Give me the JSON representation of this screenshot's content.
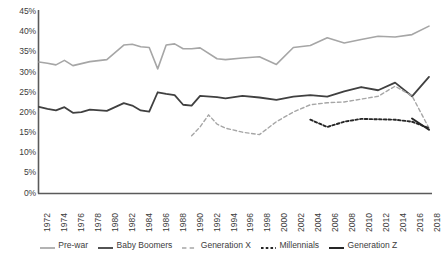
{
  "chart_data": {
    "type": "line",
    "title": "",
    "xlabel": "",
    "ylabel": "",
    "xlim": [
      1972,
      2018
    ],
    "ylim": [
      0,
      45
    ],
    "grid": false,
    "legend_position": "bottom",
    "ytick_labels": [
      "45%",
      "40%",
      "35%",
      "30%",
      "25%",
      "20%",
      "15%",
      "10%",
      "5%",
      "0%"
    ],
    "ytick_values": [
      45,
      40,
      35,
      30,
      25,
      20,
      15,
      10,
      5,
      0
    ],
    "xtick_labels": [
      "1972",
      "1974",
      "1976",
      "1978",
      "1980",
      "1982",
      "1984",
      "1986",
      "1988",
      "1990",
      "1992",
      "1994",
      "1996",
      "1998",
      "2000",
      "2002",
      "2004",
      "2006",
      "2008",
      "2010",
      "2012",
      "2014",
      "2016",
      "2018"
    ],
    "xtick_values": [
      1972,
      1974,
      1976,
      1978,
      1980,
      1982,
      1984,
      1986,
      1988,
      1990,
      1992,
      1994,
      1996,
      1998,
      2000,
      2002,
      2004,
      2006,
      2008,
      2010,
      2012,
      2014,
      2016,
      2018
    ],
    "series": [
      {
        "name": "Pre-war",
        "color": "#a6a6a6",
        "style": "solid",
        "width": 1.6,
        "x": [
          1972,
          1973,
          1974,
          1975,
          1976,
          1977,
          1978,
          1980,
          1982,
          1983,
          1984,
          1985,
          1986,
          1987,
          1988,
          1989,
          1990,
          1991,
          1993,
          1994,
          1996,
          1998,
          2000,
          2002,
          2004,
          2006,
          2008,
          2010,
          2012,
          2014,
          2016,
          2018
        ],
        "y": [
          32.6,
          32.3,
          31.9,
          33.0,
          31.7,
          32.2,
          32.7,
          33.2,
          36.8,
          37.0,
          36.4,
          36.2,
          30.9,
          36.8,
          37.1,
          35.9,
          35.9,
          36.1,
          33.4,
          33.2,
          33.6,
          33.9,
          32.0,
          36.2,
          36.7,
          38.6,
          37.3,
          38.2,
          39.0,
          38.8,
          39.4,
          41.5
        ]
      },
      {
        "name": "Baby Boomers",
        "color": "#404040",
        "style": "solid",
        "width": 1.8,
        "x": [
          1972,
          1973,
          1974,
          1975,
          1976,
          1977,
          1978,
          1980,
          1982,
          1983,
          1984,
          1985,
          1986,
          1987,
          1988,
          1989,
          1990,
          1991,
          1993,
          1994,
          1996,
          1998,
          2000,
          2002,
          2004,
          2006,
          2008,
          2010,
          2012,
          2014,
          2016,
          2018
        ],
        "y": [
          21.5,
          21.0,
          20.6,
          21.4,
          20.0,
          20.2,
          20.8,
          20.5,
          22.4,
          21.8,
          20.6,
          20.3,
          25.1,
          24.7,
          24.4,
          22.0,
          21.8,
          24.2,
          23.9,
          23.6,
          24.2,
          23.8,
          23.2,
          24.0,
          24.4,
          24.0,
          25.3,
          26.4,
          25.6,
          27.5,
          24.1,
          28.9
        ]
      },
      {
        "name": "Generation X",
        "color": "#a6a6a6",
        "style": "dashed",
        "width": 1.4,
        "x": [
          1990,
          1991,
          1992,
          1993,
          1994,
          1996,
          1998,
          2000,
          2002,
          2004,
          2006,
          2008,
          2010,
          2012,
          2014,
          2016,
          2018
        ],
        "y": [
          14.3,
          16.5,
          19.5,
          17.2,
          16.2,
          15.2,
          14.6,
          17.8,
          20.2,
          22.0,
          22.5,
          22.7,
          23.4,
          24.1,
          26.6,
          24.2,
          16.2
        ]
      },
      {
        "name": "Millennials",
        "color": "#262626",
        "style": "dotted",
        "width": 1.9,
        "x": [
          2004,
          2006,
          2008,
          2010,
          2012,
          2014,
          2016,
          2018
        ],
        "y": [
          18.3,
          16.5,
          17.8,
          18.5,
          18.4,
          18.3,
          17.8,
          16.2
        ]
      },
      {
        "name": "Generation Z",
        "color": "#262626",
        "style": "solid",
        "width": 2.0,
        "x": [
          2016,
          2018
        ],
        "y": [
          18.6,
          15.8
        ]
      }
    ]
  },
  "legend": {
    "items": [
      {
        "label": "Pre-war"
      },
      {
        "label": "Baby Boomers"
      },
      {
        "label": "Generation X"
      },
      {
        "label": "Millennials"
      },
      {
        "label": "Generation Z"
      }
    ]
  }
}
